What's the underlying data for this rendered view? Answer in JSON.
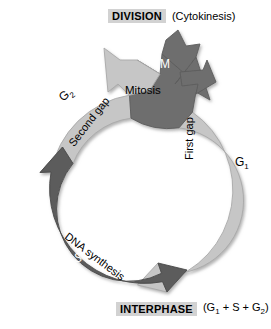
{
  "diagram": {
    "colors": {
      "light_band": "#c6c6c6",
      "light_band_edge": "#b0b0b0",
      "dark_band": "#5b5b5b",
      "dark_band_edge": "#4a4a4a",
      "mitosis_wedge": "#6e6e6e",
      "highlight_box": "#d2d2d2",
      "background": "#ffffff",
      "text_dark": "#000000",
      "text_light": "#ffffff"
    },
    "top_label": {
      "primary": "DIVISION",
      "secondary": "(Cytokinesis)"
    },
    "bottom_label": {
      "primary": "INTERPHASE",
      "secondary_parts": [
        "(G",
        "1",
        " + S + G",
        "2",
        ")"
      ],
      "secondary_plain": "(G1 + S + G2)"
    },
    "phases": [
      {
        "id": "m",
        "short": "M",
        "name": "Mitosis",
        "short_position": "on-band",
        "name_position": "inside-ring",
        "band": "dark-wedge"
      },
      {
        "id": "g1",
        "short": "G1",
        "short_sub": "1",
        "short_base": "G",
        "name": "First gap",
        "short_position": "outside-ring",
        "name_position": "inside-ring",
        "band": "light"
      },
      {
        "id": "s",
        "short": "S",
        "name": "DNA synthesis",
        "short_position": "on-band",
        "name_position": "inside-ring",
        "band": "dark"
      },
      {
        "id": "g2",
        "short": "G2",
        "short_sub": "2",
        "short_base": "G",
        "name": "Second gap",
        "short_position": "outside-ring",
        "name_position": "inside-ring",
        "band": "light"
      }
    ],
    "geometry": {
      "center_x": 138,
      "center_y": 190,
      "outer_radius": 95,
      "inner_radius": 72,
      "direction": "clockwise"
    }
  }
}
